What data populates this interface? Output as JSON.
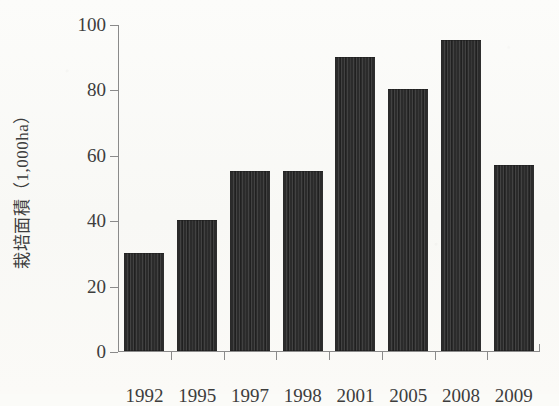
{
  "chart_data": {
    "type": "bar",
    "title": "",
    "subtitle": "",
    "xlabel": "",
    "ylabel": "栽培面積（1,000ha）",
    "categories": [
      "1992",
      "1995",
      "1997",
      "1998",
      "2001",
      "2005",
      "2008",
      "2009"
    ],
    "values": [
      30,
      40,
      55,
      55,
      90,
      80,
      95,
      57
    ],
    "series": [
      {
        "name": "栽培面積",
        "values": [
          30,
          40,
          55,
          55,
          90,
          80,
          95,
          57
        ]
      }
    ],
    "ylim": [
      0,
      100
    ],
    "yticks": [
      "0",
      "20",
      "40",
      "60",
      "80",
      "100"
    ],
    "ytick_values": [
      0,
      20,
      40,
      60,
      80,
      100
    ],
    "grid": false,
    "legend": false,
    "legend_position": "none",
    "annotations": [],
    "bar_color": "#2b2b2b",
    "axis_color": "#8a8a8a",
    "background_color": "#fbfbf8",
    "text_color": "#3d3d3d",
    "units": "1,000ha"
  }
}
